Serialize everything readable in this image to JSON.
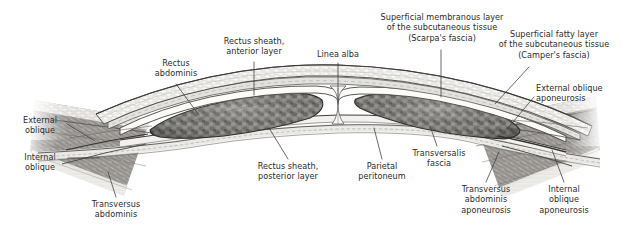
{
  "figure": {
    "background_color": "#ffffff",
    "text_color": "#2b2b2b",
    "leader_color": "#3a3a3a",
    "width": 624,
    "height": 238
  },
  "labels": [
    {
      "id": "rectus-abdominis",
      "text": "Rectus\nabdominis",
      "align": "center",
      "x": 143,
      "y": 58,
      "w": 66,
      "leader": [
        [
          176,
          84
        ],
        [
          199,
          115
        ]
      ]
    },
    {
      "id": "rectus-sheath-anterior-layer",
      "text": "Rectus sheath,\nanterior layer",
      "align": "center",
      "x": 212,
      "y": 36,
      "w": 84,
      "leader": [
        [
          254,
          62
        ],
        [
          254,
          95
        ]
      ]
    },
    {
      "id": "linea-alba",
      "text": "Linea alba",
      "align": "center",
      "x": 310,
      "y": 49,
      "w": 56,
      "leader": [
        [
          338,
          63
        ],
        [
          338,
          104
        ]
      ]
    },
    {
      "id": "superficial-membranous-layer",
      "text": "Superficial membranous layer\nof the subcutaneous tissue\n(Scarpa's fascia)",
      "align": "center",
      "x": 372,
      "y": 12,
      "w": 140,
      "leader": [
        [
          441,
          50
        ],
        [
          441,
          97
        ]
      ]
    },
    {
      "id": "superficial-fatty-layer",
      "text": "Superficial fatty layer\nof the subcutaneous tissue\n(Camper's fascia)",
      "align": "center",
      "x": 491,
      "y": 29,
      "w": 126,
      "leader": [
        [
          529,
          67
        ],
        [
          495,
          104
        ]
      ]
    },
    {
      "id": "external-oblique-aponeurosis",
      "text": "External oblique\naponeurosis",
      "align": "left",
      "x": 536,
      "y": 83,
      "w": 84,
      "leader": [
        [
          534,
          97
        ],
        [
          508,
          128
        ]
      ]
    },
    {
      "id": "external-oblique",
      "text": "External\noblique",
      "align": "center",
      "x": 14,
      "y": 115,
      "w": 52,
      "leader": [
        [
          67,
          124
        ],
        [
          95,
          141
        ]
      ]
    },
    {
      "id": "internal-oblique",
      "text": "Internal\noblique",
      "align": "center",
      "x": 14,
      "y": 152,
      "w": 52,
      "leader": [
        [
          68,
          158
        ],
        [
          99,
          158
        ]
      ]
    },
    {
      "id": "transversus-abdominis",
      "text": "Transversus\nabdominis",
      "align": "center",
      "x": 82,
      "y": 199,
      "w": 68,
      "leader": [
        [
          116,
          197
        ],
        [
          108,
          172
        ]
      ]
    },
    {
      "id": "rectus-sheath-posterior-layer",
      "text": "Rectus sheath,\nposterior layer",
      "align": "center",
      "x": 246,
      "y": 161,
      "w": 84,
      "leader": [
        [
          288,
          159
        ],
        [
          269,
          128
        ]
      ]
    },
    {
      "id": "parietal-peritoneum",
      "text": "Parietal\nperitoneum",
      "align": "center",
      "x": 349,
      "y": 161,
      "w": 66,
      "leader": [
        [
          382,
          159
        ],
        [
          374,
          128
        ]
      ]
    },
    {
      "id": "transversalis-fascia",
      "text": "Transversalis\nfascia",
      "align": "center",
      "x": 402,
      "y": 148,
      "w": 74,
      "leader": [
        [
          437,
          146
        ],
        [
          430,
          126
        ]
      ]
    },
    {
      "id": "transversus-abdominis-aponeurosis",
      "text": "Transversus\nabdominis\naponeurosis",
      "align": "center",
      "x": 448,
      "y": 184,
      "w": 76,
      "leader": [
        [
          486,
          182
        ],
        [
          499,
          152
        ]
      ]
    },
    {
      "id": "internal-oblique-aponeurosis",
      "text": "Internal\noblique\naponeurosis",
      "align": "center",
      "x": 527,
      "y": 184,
      "w": 74,
      "leader": [
        [
          564,
          182
        ],
        [
          552,
          150
        ]
      ]
    }
  ]
}
